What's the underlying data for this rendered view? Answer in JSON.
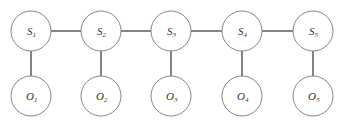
{
  "diagram": {
    "colors": {
      "node_stroke": "#7a7a7a",
      "edge_stroke": "#333333",
      "label": "#333333",
      "background": "#ffffff"
    },
    "hidden_states": [
      {
        "id": "S1",
        "base": "S",
        "sub": "1"
      },
      {
        "id": "S2",
        "base": "S",
        "sub": "2"
      },
      {
        "id": "S3",
        "base": "S",
        "sub": "3"
      },
      {
        "id": "S4",
        "base": "S",
        "sub": "4"
      },
      {
        "id": "S5",
        "base": "S",
        "sub": "5"
      }
    ],
    "observations": [
      {
        "id": "O1",
        "base": "O",
        "sub": "1"
      },
      {
        "id": "O2",
        "base": "O",
        "sub": "2"
      },
      {
        "id": "O3",
        "base": "O",
        "sub": "3"
      },
      {
        "id": "O4",
        "base": "O",
        "sub": "4"
      },
      {
        "id": "O5",
        "base": "O",
        "sub": "5"
      }
    ],
    "edges": [
      {
        "from": "S1",
        "to": "S2"
      },
      {
        "from": "S2",
        "to": "S3"
      },
      {
        "from": "S3",
        "to": "S4"
      },
      {
        "from": "S4",
        "to": "S5"
      },
      {
        "from": "S1",
        "to": "O1"
      },
      {
        "from": "S2",
        "to": "O2"
      },
      {
        "from": "S3",
        "to": "O3"
      },
      {
        "from": "S4",
        "to": "O4"
      },
      {
        "from": "S5",
        "to": "O5"
      }
    ]
  }
}
